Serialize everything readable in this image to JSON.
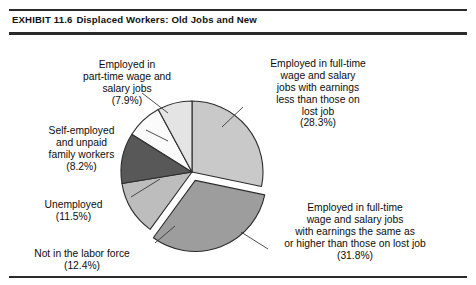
{
  "exhibit": {
    "number": "EXHIBIT 11.6",
    "title": "Displaced Workers: Old Jobs and New"
  },
  "chart_data": {
    "type": "pie",
    "title": "Displaced Workers: Old Jobs and New",
    "units": "percent",
    "legend_position": "callout-labels",
    "grid": false,
    "categories": [
      "Employed in full-time wage and salary jobs with earnings less than those on lost job",
      "Employed in full-time wage and salary jobs with earnings the same as or higher than those on lost job",
      "Not in the labor force",
      "Unemployed",
      "Self-employed and unpaid family workers",
      "Employed in part-time wage and salary jobs"
    ],
    "values": [
      28.3,
      31.8,
      12.4,
      11.5,
      8.2,
      7.9
    ],
    "value_labels": [
      "(28.3%)",
      "(31.8%)",
      "(12.4%)",
      "(11.5%)",
      "(8.2%)",
      "(7.9%)"
    ],
    "slice_colors": [
      "#c9c9c9",
      "#9d9d9d",
      "#bdbdbd",
      "#585858",
      "#fbfbfb",
      "#e4e4e4"
    ],
    "exploded": [
      false,
      true,
      false,
      false,
      false,
      false
    ],
    "start_angle_deg": -90,
    "direction": "clockwise"
  },
  "slices": [
    {
      "key": "lessthan",
      "lines": "Employed in full-time\nwage and salary\njobs with earnings\nless than those on\nlost job",
      "pct": "(28.3%)",
      "value": 28.3,
      "color": "#c9c9c9"
    },
    {
      "key": "sameorhigher",
      "lines": "Employed in full-time\nwage and salary jobs\nwith earnings the same as\nor higher than those on lost job",
      "pct": "(31.8%)",
      "value": 31.8,
      "color": "#9d9d9d"
    },
    {
      "key": "notinlaborforce",
      "lines": "Not in the labor force",
      "pct": "(12.4%)",
      "value": 12.4,
      "color": "#bdbdbd"
    },
    {
      "key": "unemployed",
      "lines": "Unemployed",
      "pct": "(11.5%)",
      "value": 11.5,
      "color": "#585858"
    },
    {
      "key": "selfemployed",
      "lines": "Self-employed\nand unpaid\nfamily workers",
      "pct": "(8.2%)",
      "value": 8.2,
      "color": "#fbfbfb"
    },
    {
      "key": "parttime",
      "lines": "Employed in\npart-time wage and\nsalary jobs",
      "pct": "(7.9%)",
      "value": 7.9,
      "color": "#e4e4e4"
    }
  ]
}
